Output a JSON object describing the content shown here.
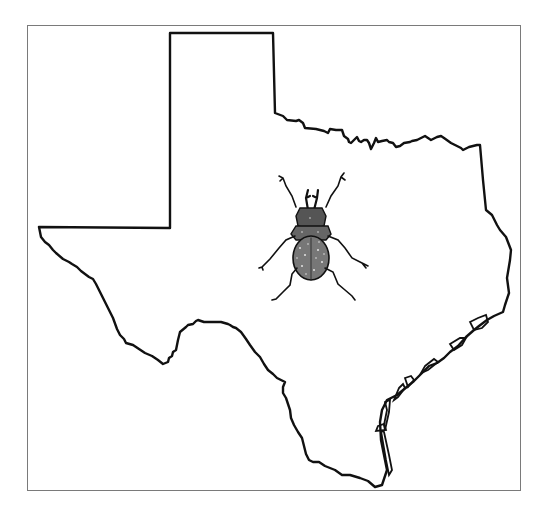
{
  "figure": {
    "illustration": "beetle (dorsal view, stippled engraving)",
    "outline_color": "#111111",
    "frame_color": "#7a7a7a",
    "background_color": "#ffffff"
  },
  "map": {
    "region": "Texas",
    "labels": []
  }
}
